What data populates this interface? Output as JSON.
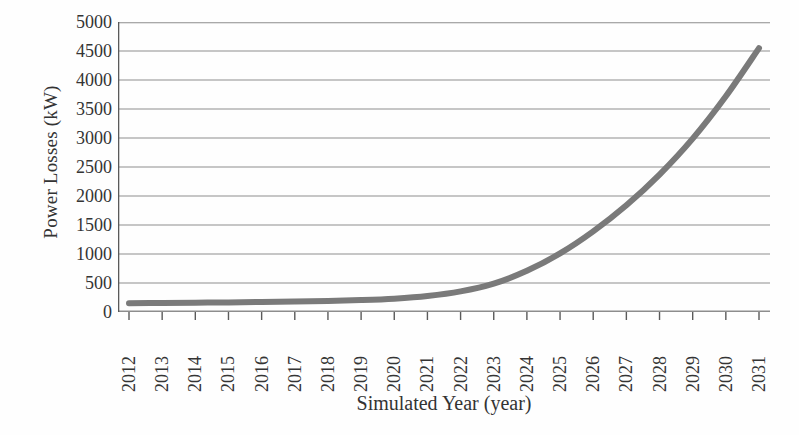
{
  "chart_data": {
    "type": "line",
    "title": "",
    "subtitle": "",
    "xlabel": "Simulated Year (year)",
    "ylabel": "Power Losses (kW)",
    "xlim": [
      2012,
      2031
    ],
    "ylim": [
      0,
      5000
    ],
    "y_ticks": [
      0,
      500,
      1000,
      1500,
      2000,
      2500,
      3000,
      3500,
      4000,
      4500,
      5000
    ],
    "y_tick_labels": [
      "0",
      "500",
      "1000",
      "1500",
      "2000",
      "2500",
      "3000",
      "3500",
      "4000",
      "4500",
      "5000"
    ],
    "x_ticks": [
      2012,
      2013,
      2014,
      2015,
      2016,
      2017,
      2018,
      2019,
      2020,
      2021,
      2022,
      2023,
      2024,
      2025,
      2026,
      2027,
      2028,
      2029,
      2030,
      2031
    ],
    "categories": [
      "2012",
      "2013",
      "2014",
      "2015",
      "2016",
      "2017",
      "2018",
      "2019",
      "2020",
      "2021",
      "2022",
      "2023",
      "2024",
      "2025",
      "2026",
      "2027",
      "2028",
      "2029",
      "2030",
      "2031"
    ],
    "x_tick_rotation": 90,
    "grid": true,
    "grid_axis": "y",
    "legend": false,
    "legend_position": "none",
    "series": [
      {
        "name": "Power Losses",
        "color": "#7a7a7a",
        "line_width": 6,
        "x": [
          2012,
          2013,
          2014,
          2015,
          2016,
          2017,
          2018,
          2019,
          2020,
          2021,
          2022,
          2023,
          2024,
          2025,
          2026,
          2027,
          2028,
          2029,
          2030,
          2031
        ],
        "values": [
          150,
          155,
          160,
          165,
          172,
          180,
          190,
          205,
          230,
          275,
          355,
          490,
          710,
          1010,
          1390,
          1840,
          2370,
          2990,
          3720,
          4550
        ]
      }
    ],
    "annotations": []
  },
  "axes": {
    "y_title": "Power Losses (kW)",
    "x_title": "Simulated Year (year)"
  },
  "colors": {
    "curve": "#7a7a7a",
    "gridline": "#8d8d8d",
    "axis": "#5a5a5a",
    "text": "#343434",
    "background": "#ffffff"
  }
}
